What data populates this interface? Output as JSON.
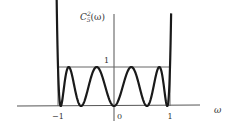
{
  "chart_data": {
    "type": "line",
    "title": "",
    "function": "Chebyshev polynomial squared, order 5: C_5^2(ω) = T_5(ω)^2",
    "order": 5,
    "ylabel": "C",
    "ylabel_sup": "2",
    "ylabel_sub": "5",
    "ylabel_arg": "(ω)",
    "xlabel": "ω",
    "x_ticks": [
      {
        "value": -1,
        "label": "−1"
      },
      {
        "value": 0,
        "label": "0"
      },
      {
        "value": 1,
        "label": "1"
      }
    ],
    "y_ticks": [
      {
        "value": 1,
        "label": "1"
      }
    ],
    "xlim": [
      -1.1,
      1.2
    ],
    "ylim": [
      0,
      2.2
    ],
    "x_range_plotted": [
      -1.03,
      1.02
    ],
    "reference_lines": [
      {
        "type": "horizontal",
        "y": 1,
        "from_x": -1,
        "to_x": 1
      },
      {
        "type": "vertical",
        "x": -1,
        "from_y": 0,
        "to_y": 1
      },
      {
        "type": "vertical",
        "x": 1,
        "from_y": 0,
        "to_y": 1
      }
    ],
    "zeros": [
      -0.951,
      -0.588,
      0,
      0.588,
      0.951
    ],
    "maxima_at_1": [
      -1,
      -0.809,
      -0.309,
      0.309,
      0.809,
      1
    ],
    "grid": false,
    "legend": "none",
    "colors": {
      "curve": "#1a1a1a",
      "axes": "#555555",
      "ref": "#666666"
    }
  }
}
